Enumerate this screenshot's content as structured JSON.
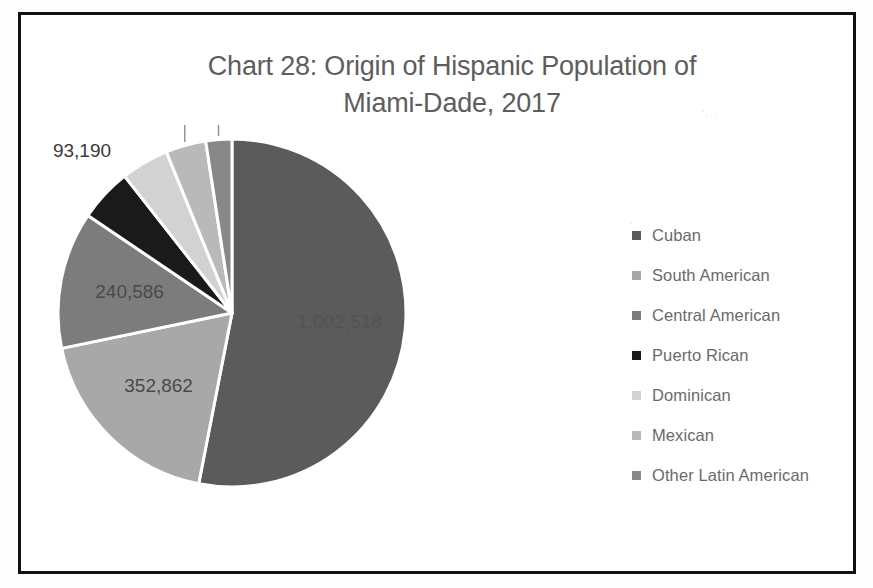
{
  "document": {
    "background_color": "#ffffff",
    "border_color": "#111111",
    "scan_artifact_1": "'...",
    "scan_artifact_2": "'"
  },
  "chart_data": {
    "type": "pie",
    "title": "Chart 28: Origin of Hispanic Population of Miami-Dade, 2017",
    "title_line_1": "Chart 28: Origin of Hispanic Population of",
    "title_line_2": "Miami-Dade, 2017",
    "xlabel": "",
    "ylabel": "",
    "legend_position": "right",
    "grid": false,
    "start_angle_deg": 0,
    "direction": "clockwise",
    "categories": [
      "Cuban",
      "South American",
      "Central American",
      "Puerto Rican",
      "Dominican",
      "Mexican",
      "Other Latin American"
    ],
    "values": [
      1002518,
      352862,
      240586,
      93190,
      83832,
      70637,
      45641
    ],
    "labels": [
      "1,002,518",
      "352,862",
      "240,586",
      "93,190",
      "83,832",
      "70,637",
      "45,641"
    ],
    "colors": [
      "#5b5b5b",
      "#a8a8a8",
      "#7c7c7c",
      "#1a1a1a",
      "#d2d2d2",
      "#b9b9b9",
      "#888888"
    ],
    "total": 1889266
  },
  "legend": {
    "items": [
      {
        "label": "Cuban",
        "color": "#5b5b5b"
      },
      {
        "label": "South American",
        "color": "#a8a8a8"
      },
      {
        "label": "Central American",
        "color": "#7c7c7c"
      },
      {
        "label": "Puerto Rican",
        "color": "#1a1a1a"
      },
      {
        "label": "Dominican",
        "color": "#d2d2d2"
      },
      {
        "label": "Mexican",
        "color": "#b9b9b9"
      },
      {
        "label": "Other Latin American",
        "color": "#888888"
      }
    ]
  }
}
